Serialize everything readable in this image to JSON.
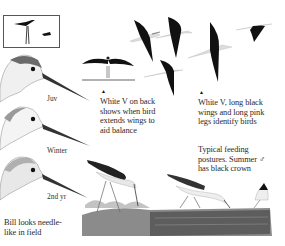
{
  "plate": {
    "subject": "Black-winged Stilt field guide plate",
    "thumbnail": {
      "label": "size comparison silhouette"
    },
    "head_labels": [
      "Juv",
      "Winter",
      "2nd yr"
    ],
    "captions": {
      "back_v": [
        "White V on back",
        "shows when bird",
        "extends wings to",
        "aid balance"
      ],
      "wings_legs": [
        "White V, long black",
        "wings and long pink",
        "legs identify birds"
      ],
      "feeding": [
        "Typical feeding",
        "postures. Summer ♂",
        "has black crown"
      ],
      "bill": [
        "Bill looks needle-",
        "like in field"
      ]
    },
    "markers": {
      "triangle": "▲"
    },
    "colors": {
      "wing_black": "#111111",
      "background": "#ffffff",
      "water": "#5a5a5a",
      "head_gray": "#8a8a8a",
      "bill": "#333333"
    }
  }
}
